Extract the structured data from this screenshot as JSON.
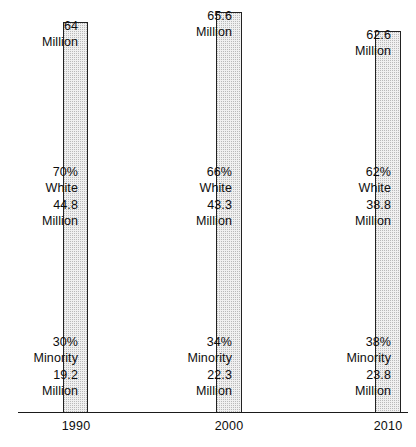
{
  "chart_data": {
    "type": "bar",
    "title": "",
    "subtitle": "",
    "xlabel": "",
    "ylabel": "",
    "categories": [
      "1990",
      "2000",
      "2010"
    ],
    "series": [
      {
        "name": "Total Population",
        "values": [
          64,
          65.6,
          62.6
        ],
        "unit": "Million"
      },
      {
        "name": "White",
        "values": [
          44.8,
          43.3,
          38.8
        ],
        "percent": [
          70,
          66,
          62
        ],
        "unit": "Million"
      },
      {
        "name": "Minority",
        "values": [
          19.2,
          22.3,
          23.8
        ],
        "percent": [
          30,
          34,
          38
        ],
        "unit": "Million"
      }
    ],
    "grid": false,
    "legend": "none",
    "axis_line": true,
    "bar_fill": "#f0f0f0",
    "bar_border": "#222222",
    "text_color": "#0d0d0d"
  },
  "columns": [
    {
      "year": "1990",
      "total": {
        "value": "64",
        "unit": "Million"
      },
      "white": {
        "percent": "70%",
        "group": "White",
        "value": "44.8",
        "unit": "Million"
      },
      "minority": {
        "percent": "30%",
        "group": "Minority",
        "value": "19.2",
        "unit": "Million"
      }
    },
    {
      "year": "2000",
      "total": {
        "value": "65.6",
        "unit": "Million"
      },
      "white": {
        "percent": "66%",
        "group": "White",
        "value": "43.3",
        "unit": "Million"
      },
      "minority": {
        "percent": "34%",
        "group": "Minority",
        "value": "22.3",
        "unit": "Million"
      }
    },
    {
      "year": "2010",
      "total": {
        "value": "62.6",
        "unit": "Million"
      },
      "white": {
        "percent": "62%",
        "group": "White",
        "value": "38.8",
        "unit": "Million"
      },
      "minority": {
        "percent": "38%",
        "group": "Minority",
        "value": "23.8",
        "unit": "Million"
      }
    }
  ]
}
